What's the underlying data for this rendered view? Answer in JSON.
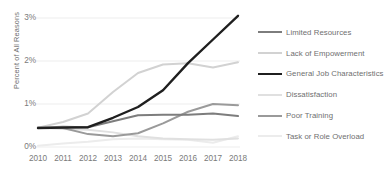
{
  "chart_data": {
    "type": "line",
    "title": "",
    "xlabel": "",
    "ylabel": "Percent of All Reasons",
    "x": [
      2010,
      2011,
      2012,
      2013,
      2014,
      2015,
      2016,
      2017,
      2018
    ],
    "x_tick_labels": [
      "2010",
      "2011",
      "2012",
      "2013",
      "2014",
      "2015",
      "2016",
      "2017",
      "2018"
    ],
    "y_tick_labels": [
      "0%",
      "1%",
      "2%",
      "3%"
    ],
    "y_tick_values": [
      0,
      1,
      2,
      3
    ],
    "ylim": [
      -0.1,
      3.25
    ],
    "xlim": [
      2010,
      2018
    ],
    "grid": true,
    "grid_axis": "y",
    "legend_position": "right",
    "series": [
      {
        "name": "Limited Resources",
        "color": "#7d7d7d",
        "width": 2.0,
        "values": [
          0.45,
          0.47,
          0.46,
          0.6,
          0.74,
          0.75,
          0.75,
          0.78,
          0.72
        ]
      },
      {
        "name": "Lack of Empowerment",
        "color": "#d2d2d2",
        "width": 2.0,
        "values": [
          0.45,
          0.58,
          0.78,
          1.28,
          1.72,
          1.92,
          1.95,
          1.85,
          1.97
        ]
      },
      {
        "name": "General Job Characteristics",
        "color": "#1f1f1f",
        "width": 2.4,
        "values": [
          0.44,
          0.45,
          0.46,
          0.68,
          0.93,
          1.32,
          1.95,
          2.5,
          3.05
        ]
      },
      {
        "name": "Dissatisfaction",
        "color": "#e0e0e0",
        "width": 2.0,
        "values": [
          0.45,
          0.42,
          0.4,
          0.34,
          0.25,
          0.2,
          0.18,
          0.17,
          0.2
        ]
      },
      {
        "name": "Poor Training",
        "color": "#9a9a9a",
        "width": 2.0,
        "values": [
          0.46,
          0.44,
          0.3,
          0.25,
          0.32,
          0.55,
          0.82,
          1.0,
          0.97
        ]
      },
      {
        "name": "Task or Role Overload",
        "color": "#ececec",
        "width": 2.0,
        "values": [
          0.03,
          0.08,
          0.12,
          0.18,
          0.2,
          0.18,
          0.17,
          0.1,
          0.25
        ]
      }
    ]
  },
  "axes": {
    "y_title": "Percent of All Reasons"
  }
}
